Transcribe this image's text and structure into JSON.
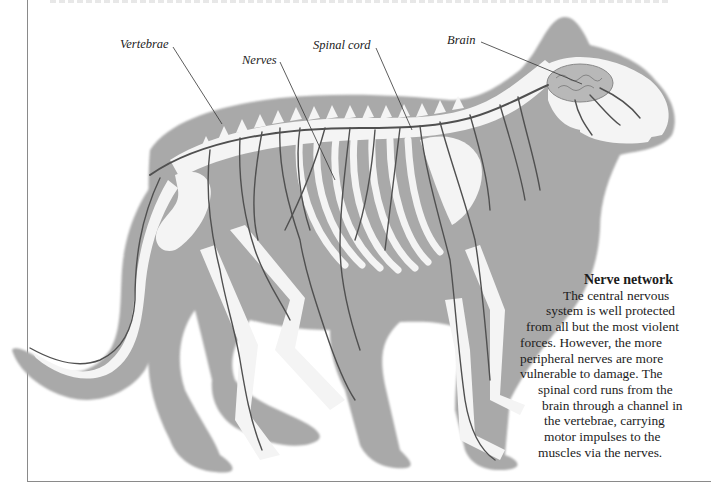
{
  "figure": {
    "labels": {
      "vertebrae": "Vertebrae",
      "nerves": "Nerves",
      "spinal_cord": "Spinal cord",
      "brain": "Brain"
    },
    "caption": {
      "title": "Nerve network",
      "lines": [
        "The central nervous",
        "system is well protected",
        "from all but the most violent",
        "forces. However, the more",
        "peripheral nerves are more",
        "vulnerable to damage. The",
        "spinal cord runs from the",
        "brain through a channel in",
        "the vertebrae, carrying",
        "motor impulses to the",
        "muscles via the nerves."
      ]
    },
    "colors": {
      "body": "#a9a9a9",
      "bone": "#f4f4f4",
      "nerve": "#505050",
      "brain": "#b8b8b8",
      "text": "#1c1c1c",
      "frame": "#8a8a8a"
    }
  }
}
